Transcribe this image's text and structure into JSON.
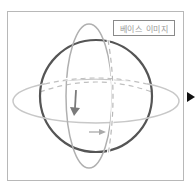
{
  "diagram": {
    "label": "베이스 이미지",
    "colors": {
      "sphere": "#555555",
      "orbit": "#c8c8c8",
      "vertical_orbit": "#b0b0b0",
      "rotation_arrow": "#7a7a7a",
      "horizontal_arrow": "#aaaaaa",
      "frame": "#b8b8b8",
      "next_arrow": "#111111"
    }
  }
}
